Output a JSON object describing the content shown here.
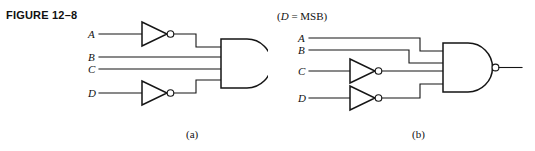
{
  "figure": {
    "title": "FIGURE 12–8",
    "note": {
      "open_paren": "(",
      "variable": "D",
      "equals_msb": " =  MSB)"
    }
  },
  "captions": {
    "a": "(a)",
    "b": "(b)"
  },
  "colors": {
    "line": "#151515",
    "background": "#ffffff",
    "text": "#111111"
  },
  "circuits": [
    {
      "id": "a",
      "caption": "(a)",
      "gate": {
        "type": "NAND",
        "inputs": 4,
        "output_bubble": true,
        "label": "nand-gate"
      },
      "inputs": [
        {
          "label": "A",
          "inverted": true,
          "y": 34
        },
        {
          "label": "B",
          "inverted": false,
          "y": 57
        },
        {
          "label": "C",
          "inverted": false,
          "y": 69
        },
        {
          "label": "D",
          "inverted": true,
          "y": 93
        }
      ],
      "inverters": [
        {
          "on_input": "A",
          "bubble": true
        },
        {
          "on_input": "D",
          "bubble": true
        }
      ]
    },
    {
      "id": "b",
      "caption": "(b)",
      "gate": {
        "type": "NAND",
        "inputs": 4,
        "output_bubble": true,
        "label": "nand-gate"
      },
      "inputs": [
        {
          "label": "A",
          "inverted": false,
          "y": 38
        },
        {
          "label": "B",
          "inverted": false,
          "y": 50
        },
        {
          "label": "C",
          "inverted": true,
          "y": 71
        },
        {
          "label": "D",
          "inverted": true,
          "y": 98
        }
      ],
      "inverters": [
        {
          "on_input": "C",
          "bubble": true
        },
        {
          "on_input": "D",
          "bubble": true
        }
      ]
    }
  ],
  "pin_labels": {
    "a": {
      "A": "A",
      "B": "B",
      "C": "C",
      "D": "D"
    },
    "b": {
      "A": "A",
      "B": "B",
      "C": "C",
      "D": "D"
    }
  }
}
